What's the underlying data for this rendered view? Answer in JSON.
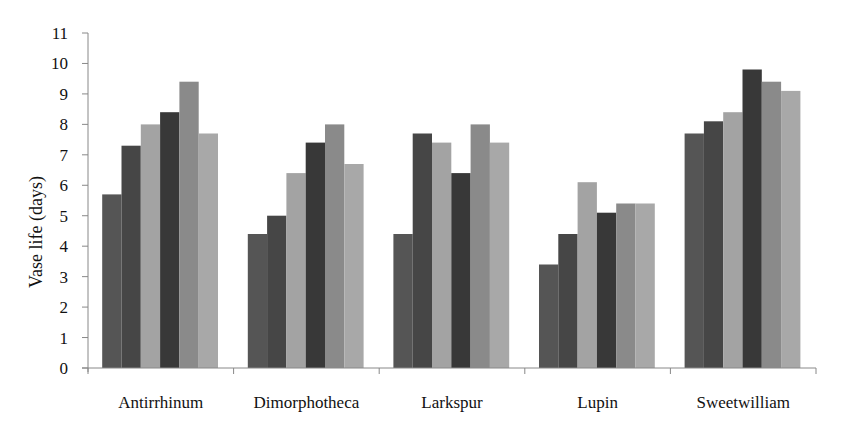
{
  "chart_data": {
    "type": "bar",
    "title": "",
    "xlabel": "",
    "ylabel": "Vase life (days)",
    "ylim": [
      0,
      11
    ],
    "yticks": [
      0,
      1,
      2,
      3,
      4,
      5,
      6,
      7,
      8,
      9,
      10,
      11
    ],
    "grid": false,
    "legend": null,
    "categories": [
      "Antirrhinum",
      "Dimorphotheca",
      "Larkspur",
      "Lupin",
      "Sweetwilliam"
    ],
    "series": [
      {
        "name": "Series 1",
        "color": "#555555",
        "values": [
          5.7,
          4.4,
          4.4,
          3.4,
          7.7
        ]
      },
      {
        "name": "Series 2",
        "color": "#464646",
        "values": [
          7.3,
          5.0,
          7.7,
          4.4,
          8.1
        ]
      },
      {
        "name": "Series 3",
        "color": "#a3a3a3",
        "values": [
          8.0,
          6.4,
          7.4,
          6.1,
          8.4
        ]
      },
      {
        "name": "Series 4",
        "color": "#383838",
        "values": [
          8.4,
          7.4,
          6.4,
          5.1,
          9.8
        ]
      },
      {
        "name": "Series 5",
        "color": "#8a8a8a",
        "values": [
          9.4,
          8.0,
          8.0,
          5.4,
          9.4
        ]
      },
      {
        "name": "Series 6",
        "color": "#a8a8a8",
        "values": [
          7.7,
          6.7,
          7.4,
          5.4,
          9.1
        ]
      }
    ]
  }
}
